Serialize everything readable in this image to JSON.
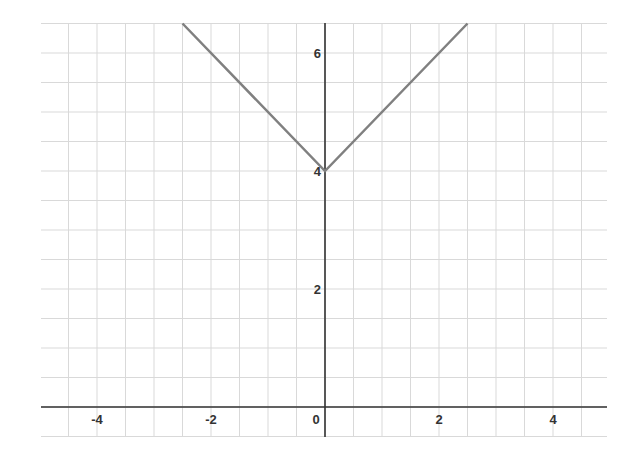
{
  "chart_data": {
    "type": "line",
    "title": "",
    "xlabel": "",
    "ylabel": "",
    "function": "y = |x| + 4",
    "xlim": [
      -5,
      5
    ],
    "ylim": [
      0,
      6.5
    ],
    "grid": true,
    "grid_step": 0.5,
    "x_ticks": [
      -4,
      -2,
      0,
      2,
      4
    ],
    "y_ticks": [
      2,
      4,
      6
    ],
    "x_tick_labels": [
      "-4",
      "-2",
      "0",
      "2",
      "4"
    ],
    "y_tick_labels": [
      "2",
      "4",
      "6"
    ],
    "series": [
      {
        "name": "y = |x| + 4",
        "x": [
          -2.5,
          0,
          2.5
        ],
        "y": [
          6.5,
          4,
          6.5
        ],
        "color": "#808080"
      }
    ]
  },
  "colors": {
    "axis": "#333333",
    "grid": "#d9d9d9",
    "line": "#808080"
  }
}
